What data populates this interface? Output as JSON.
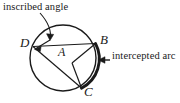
{
  "figure": {
    "background_color": "#ffffff",
    "stroke_color": "#1a1a1a",
    "annotations": {
      "inscribed_angle_label": "inscribed angle",
      "intercepted_arc_label": "intercepted arc"
    },
    "points": {
      "d": "D",
      "b": "B",
      "a": "A",
      "c": "C"
    },
    "geometry": {
      "circle": {
        "cx": 63,
        "cy": 58,
        "r": 33
      },
      "vertices": {
        "D": {
          "x": 33,
          "y": 46
        },
        "B": {
          "x": 95,
          "y": 44
        },
        "C": {
          "x": 81,
          "y": 88
        },
        "A": {
          "x": 63,
          "y": 58
        },
        "center_vertex": {
          "x": 72,
          "y": 63
        }
      },
      "chords": [
        {
          "from": "D",
          "to": "B"
        },
        {
          "from": "D",
          "to": "C"
        },
        {
          "from": "center_vertex",
          "to": "B"
        },
        {
          "from": "center_vertex",
          "to": "C"
        }
      ],
      "bold_arc": {
        "from": "B",
        "to": "C",
        "description": "intercepted arc BC drawn thick"
      }
    }
  }
}
